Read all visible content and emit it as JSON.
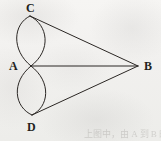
{
  "figure": {
    "name": "two-lens-graph-diagram",
    "background_color": "#f4f3f1",
    "ink_color": "#231f20",
    "canvas": {
      "width": 161,
      "height": 141
    }
  },
  "vertices": [
    {
      "id": "C",
      "label": "C",
      "x": 30,
      "y": 16,
      "label_x": 26,
      "label_y": 2
    },
    {
      "id": "A",
      "label": "A",
      "x": 31,
      "y": 66,
      "label_x": 9,
      "label_y": 60
    },
    {
      "id": "B",
      "label": "B",
      "x": 138,
      "y": 66,
      "label_x": 144,
      "label_y": 60
    },
    {
      "id": "D",
      "label": "D",
      "x": 32,
      "y": 115,
      "label_x": 27,
      "label_y": 121
    }
  ],
  "edges": [
    {
      "from": "C",
      "to": "A",
      "kind": "arc",
      "bulge": "left",
      "name": "arc-c-a-left",
      "extreme_x": 11
    },
    {
      "from": "C",
      "to": "A",
      "kind": "arc",
      "bulge": "right",
      "name": "arc-c-a-right",
      "extreme_x": 52
    },
    {
      "from": "A",
      "to": "D",
      "kind": "arc",
      "bulge": "left",
      "name": "arc-a-d-left",
      "extreme_x": 11
    },
    {
      "from": "A",
      "to": "D",
      "kind": "arc",
      "bulge": "right",
      "name": "arc-a-d-right",
      "extreme_x": 52
    },
    {
      "from": "C",
      "to": "B",
      "kind": "line",
      "name": "line-c-b"
    },
    {
      "from": "A",
      "to": "B",
      "kind": "line",
      "name": "line-a-b"
    },
    {
      "from": "D",
      "to": "B",
      "kind": "line",
      "name": "line-d-b"
    }
  ],
  "bleed_through": [
    {
      "text": "上图中，由 A 到 B 的路径有几条",
      "x": 84
    }
  ]
}
